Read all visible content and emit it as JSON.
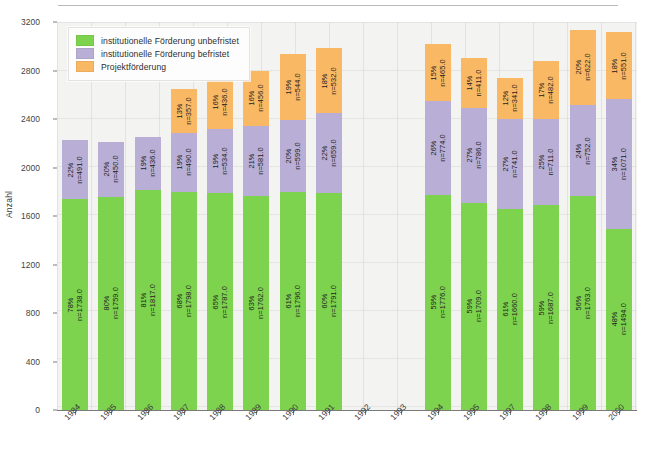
{
  "chart_data": {
    "type": "bar",
    "subtype": "stacked-bar",
    "title": "",
    "xlabel": "",
    "ylabel": "Anzahl",
    "ylim": [
      0,
      3200
    ],
    "ytick_labels": [
      "0",
      "400",
      "800",
      "1200",
      "1600",
      "2000",
      "2400",
      "2800",
      "3200"
    ],
    "ytick_values": [
      0,
      400,
      800,
      1200,
      1600,
      2000,
      2400,
      2800,
      3200
    ],
    "grid": true,
    "legend_position": "top-left",
    "categories": [
      "1984",
      "1985",
      "1986",
      "1987",
      "1988",
      "1989",
      "1990",
      "1991",
      "1992",
      "1993",
      "1994",
      "1995",
      "1997",
      "1998",
      "1999",
      "2000"
    ],
    "series": [
      {
        "name": "institutionelle Förderung unbefristet",
        "color": "#7ed34e",
        "values": [
          1738.0,
          1759.0,
          1817.0,
          1798.0,
          1787.0,
          1762.0,
          1796.0,
          1791.0,
          null,
          null,
          1776.0,
          1709.0,
          1660.0,
          1687.0,
          1763.0,
          1494.0
        ],
        "percents": [
          "78%",
          "80%",
          "81%",
          "68%",
          "65%",
          "63%",
          "61%",
          "60%",
          null,
          null,
          "59%",
          "59%",
          "61%",
          "59%",
          "56%",
          "48%"
        ],
        "labels": [
          "n=1738.0",
          "n=1759.0",
          "n=1817.0",
          "n=1798.0",
          "n=1787.0",
          "n=1762.0",
          "n=1796.0",
          "n=1791.0",
          null,
          null,
          "n=1776.0",
          "n=1709.0",
          "n=1660.0",
          "n=1687.0",
          "n=1763.0",
          "n=1494.0"
        ]
      },
      {
        "name": "institutionelle Förderung befristet",
        "color": "#b8aed6",
        "values": [
          491.0,
          450.0,
          436.0,
          490.0,
          534.0,
          581.0,
          599.0,
          659.0,
          null,
          null,
          774.0,
          786.0,
          741.0,
          711.0,
          752.0,
          1071.0
        ],
        "percents": [
          "22%",
          "20%",
          "19%",
          "19%",
          "19%",
          "21%",
          "20%",
          "22%",
          null,
          null,
          "26%",
          "27%",
          "27%",
          "25%",
          "24%",
          "34%"
        ],
        "labels": [
          "n=491.0",
          "n=450.0",
          "n=436.0",
          "n=490.0",
          "n=534.0",
          "n=581.0",
          "n=599.0",
          "n=659.0",
          null,
          null,
          "n=774.0",
          "n=786.0",
          "n=741.0",
          "n=711.0",
          "n=752.0",
          "n=1071.0"
        ]
      },
      {
        "name": "Projektförderung",
        "color": "#f9b863",
        "values": [
          0,
          0,
          0,
          357.0,
          436.0,
          456.0,
          544.0,
          532.0,
          null,
          null,
          465.0,
          411.0,
          341.0,
          482.0,
          622.0,
          551.0
        ],
        "percents": [
          null,
          null,
          null,
          "13%",
          "16%",
          "16%",
          "19%",
          "18%",
          null,
          null,
          "15%",
          "14%",
          "12%",
          "17%",
          "20%",
          "18%"
        ],
        "labels": [
          null,
          null,
          null,
          "n=357.0",
          "n=436.0",
          "n=456.0",
          "n=544.0",
          "n=532.0",
          null,
          null,
          "n=465.0",
          "n=411.0",
          "n=341.0",
          "n=482.0",
          "n=622.0",
          "n=551.0"
        ]
      }
    ],
    "totals": [
      2229,
      2209,
      2253,
      2645,
      2757,
      2799,
      2939,
      2982,
      null,
      null,
      3015,
      2906,
      2742,
      2880,
      3137,
      3116
    ],
    "empty_categories": [
      "1992",
      "1993"
    ],
    "note_missing_category": "1996"
  },
  "legend": {
    "items": [
      {
        "label": "institutionelle Förderung unbefristet",
        "color": "#7ed34e"
      },
      {
        "label": "institutionelle Förderung befristet",
        "color": "#b8aed6"
      },
      {
        "label": "Projektförderung",
        "color": "#f9b863"
      }
    ]
  },
  "axes": {
    "y_title": "Anzahl"
  }
}
